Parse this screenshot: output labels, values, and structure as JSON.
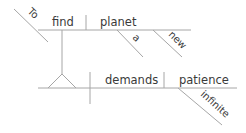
{
  "diagram": {
    "type": "sentence-diagram",
    "sentence": "To find a new planet demands infinite patience",
    "colors": {
      "line": "#a6a6a6",
      "text": "#3a3a3a",
      "background": "#ffffff"
    },
    "infinitive_phrase": {
      "marker": "To",
      "verb": "find",
      "object": "planet",
      "object_modifiers": [
        "a",
        "new"
      ]
    },
    "main_clause": {
      "subject": "[infinitive phrase]",
      "verb": "demands",
      "object": "patience",
      "object_modifiers": [
        "infinite"
      ]
    },
    "labels": {
      "to": "To",
      "find": "find",
      "planet": "planet",
      "a": "a",
      "new": "new",
      "demands": "demands",
      "patience": "patience",
      "infinite": "infinite"
    }
  }
}
